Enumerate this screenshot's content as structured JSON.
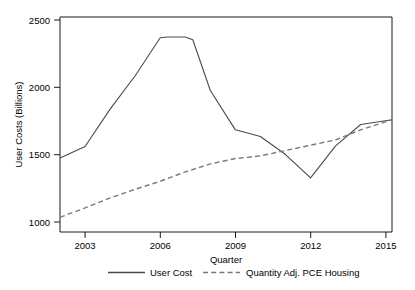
{
  "chart_data": {
    "type": "line",
    "title": "",
    "xlabel": "Quarter",
    "ylabel": "User Costs (Billions)",
    "xlim": [
      2002.0,
      2015.25
    ],
    "ylim": [
      950,
      2560
    ],
    "xticks": [
      "2003",
      "2006",
      "2009",
      "2012",
      "2015"
    ],
    "xtick_values": [
      2003,
      2006,
      2009,
      2012,
      2015
    ],
    "yticks": [
      "1000",
      "1500",
      "2000",
      "2500"
    ],
    "ytick_values": [
      1000,
      1500,
      2000,
      2500
    ],
    "grid": false,
    "legend_position": "bottom",
    "series": [
      {
        "name": "User Cost",
        "style": "solid",
        "color": "#4a4a4a",
        "x": [
          2002.0,
          2003.0,
          2004.0,
          2005.0,
          2006.0,
          2006.3,
          2007.0,
          2007.3,
          2008.0,
          2009.0,
          2010.0,
          2011.0,
          2012.0,
          2013.0,
          2014.0,
          2015.25
        ],
        "y": [
          1505,
          1590,
          1870,
          2120,
          2405,
          2410,
          2410,
          2390,
          2010,
          1715,
          1665,
          1530,
          1355,
          1595,
          1755,
          1790
        ]
      },
      {
        "name": "Quantity Adj. PCE Housing",
        "style": "dashed",
        "color": "#7a7a7a",
        "x": [
          2002.0,
          2003.0,
          2004.0,
          2005.0,
          2006.0,
          2007.0,
          2008.0,
          2009.0,
          2010.0,
          2011.0,
          2012.0,
          2013.0,
          2014.0,
          2015.25
        ],
        "y": [
          1060,
          1130,
          1205,
          1270,
          1330,
          1400,
          1460,
          1500,
          1520,
          1560,
          1600,
          1640,
          1715,
          1790
        ]
      }
    ]
  },
  "legend": {
    "entries": [
      {
        "label": "User Cost",
        "style": "solid"
      },
      {
        "label": "Quantity Adj. PCE Housing",
        "style": "dashed"
      }
    ]
  },
  "colors": {
    "series_solid": "#4a4a4a",
    "series_dashed": "#7a7a7a",
    "axis": "#000000",
    "background": "#ffffff"
  }
}
